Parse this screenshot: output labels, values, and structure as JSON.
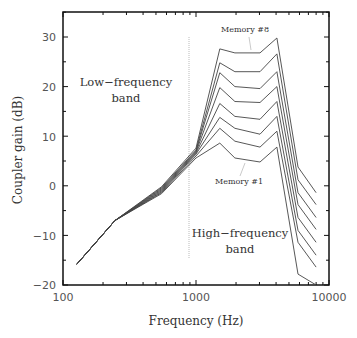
{
  "chart_data": {
    "type": "line",
    "title": "",
    "xlabel": "Frequency (Hz)",
    "ylabel": "Coupler gain (dB)",
    "xscale": "log",
    "xlim": [
      100,
      10000
    ],
    "ylim": [
      -20,
      35
    ],
    "x_ticks": [
      100,
      1000,
      10000
    ],
    "x_tick_labels": [
      "100",
      "1000",
      "10000"
    ],
    "y_ticks": [
      -20,
      -10,
      0,
      10,
      20,
      30
    ],
    "y_tick_labels": [
      "-20",
      "-10",
      "0",
      "10",
      "20",
      "30"
    ],
    "grid": false,
    "legend": null,
    "crossover_frequency": 890,
    "x": [
      127,
      246,
      550,
      1000,
      1510,
      1960,
      3030,
      4060,
      5850,
      8000
    ],
    "series": [
      {
        "name": "Memory #1",
        "values": [
          -15.8,
          -7.0,
          -1.6,
          5.6,
          8.6,
          5.6,
          4.8,
          7.8,
          -17.8,
          -20.0
        ]
      },
      {
        "name": "Memory #2",
        "values": [
          -15.8,
          -7.0,
          -1.4,
          6.0,
          11.6,
          9.0,
          7.8,
          11.0,
          -11.4,
          -16.4
        ]
      },
      {
        "name": "Memory #3",
        "values": [
          -15.8,
          -7.0,
          -1.2,
          6.4,
          13.8,
          11.6,
          10.4,
          14.0,
          -9.0,
          -14.0
        ]
      },
      {
        "name": "Memory #4",
        "values": [
          -15.8,
          -7.0,
          -1.0,
          6.6,
          16.6,
          14.0,
          13.4,
          17.0,
          -6.4,
          -11.4
        ]
      },
      {
        "name": "Memory #5",
        "values": [
          -15.8,
          -7.0,
          -0.8,
          6.8,
          19.8,
          17.0,
          16.8,
          20.0,
          -3.8,
          -8.8
        ]
      },
      {
        "name": "Memory #6",
        "values": [
          -15.8,
          -7.0,
          -0.6,
          7.0,
          22.8,
          20.0,
          19.6,
          23.0,
          -1.4,
          -6.4
        ]
      },
      {
        "name": "Memory #7",
        "values": [
          -15.8,
          -7.0,
          -0.4,
          7.2,
          24.8,
          23.0,
          23.0,
          26.6,
          1.2,
          -3.8
        ]
      },
      {
        "name": "Memory #8",
        "values": [
          -15.8,
          -7.0,
          -0.2,
          7.6,
          27.6,
          26.8,
          26.8,
          29.8,
          3.8,
          -1.4
        ]
      }
    ],
    "annotations": [
      {
        "text": "Memory #8",
        "points_to": "top curve near 2000 Hz"
      },
      {
        "text": "Memory #1",
        "points_to": "bottom curve near 2000 Hz"
      },
      {
        "text": "Low-frequency band",
        "region": "left of crossover"
      },
      {
        "text": "High-frequency band",
        "region": "right of crossover"
      }
    ]
  },
  "labels": {
    "xlabel": "Frequency (Hz)",
    "ylabel": "Coupler gain (dB)",
    "low_band_line1": "Low−frequency",
    "low_band_line2": "band",
    "high_band_line1": "High−frequency",
    "high_band_line2": "band",
    "memory_top": "Memory #8",
    "memory_bottom": "Memory #1",
    "x_tick_100": "100",
    "x_tick_1000": "1000",
    "x_tick_10000": "10000",
    "y_tick_30": "30",
    "y_tick_20": "20",
    "y_tick_10": "10",
    "y_tick_0": "0",
    "y_tick_m10": "−10",
    "y_tick_m20": "−20"
  },
  "colors": {
    "line": "#444444",
    "axis": "#111111",
    "crossover": "#bbbbbb"
  }
}
